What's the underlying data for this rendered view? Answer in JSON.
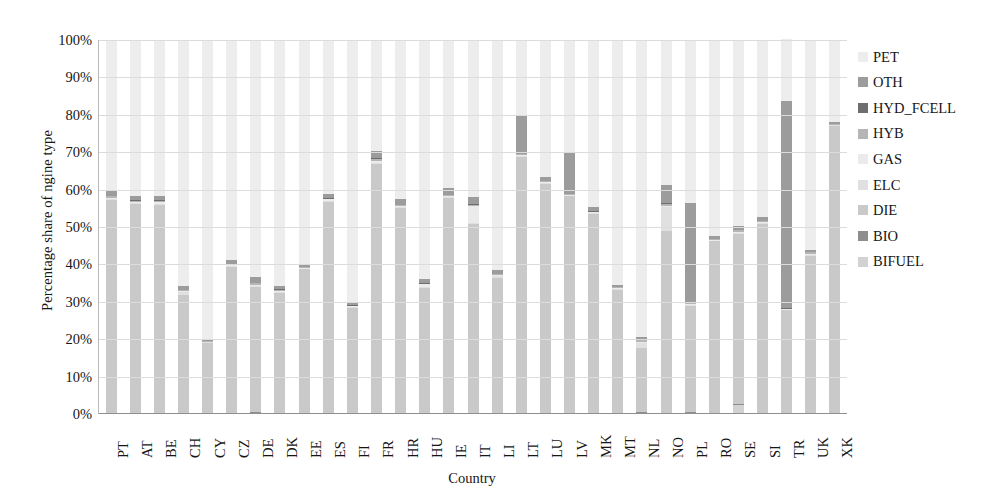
{
  "chart_data": {
    "type": "bar",
    "subtype": "stacked-100-percent",
    "title": "",
    "xlabel": "Country",
    "ylabel": "Percentage share of ngine type",
    "ylim": [
      0,
      100
    ],
    "ytick_labels": [
      "0%",
      "10%",
      "20%",
      "30%",
      "40%",
      "50%",
      "60%",
      "70%",
      "80%",
      "90%",
      "100%"
    ],
    "ytick_values": [
      0,
      10,
      20,
      30,
      40,
      50,
      60,
      70,
      80,
      90,
      100
    ],
    "grid": true,
    "legend_position": "right",
    "categories": [
      "PT",
      "AT",
      "BE",
      "CH",
      "CY",
      "CZ",
      "DE",
      "DK",
      "EE",
      "ES",
      "FI",
      "FR",
      "HR",
      "HU",
      "IE",
      "IT",
      "LI",
      "LT",
      "LU",
      "LV",
      "MK",
      "MT",
      "NL",
      "NO",
      "PL",
      "RO",
      "SE",
      "SI",
      "TR",
      "UK",
      "XK"
    ],
    "series": [
      {
        "name": "BIFUEL",
        "color": "#d2d2d2",
        "values": [
          0.2,
          0.2,
          0.3,
          0.2,
          0.1,
          0.3,
          0.4,
          0.3,
          0.2,
          0.3,
          0.3,
          0.3,
          0.2,
          0.2,
          0.2,
          0.3,
          0.2,
          0.2,
          0.3,
          0.2,
          0.1,
          0.2,
          0.5,
          0.3,
          0.4,
          0.2,
          2.5,
          0.2,
          0.2,
          0.2,
          0.1
        ]
      },
      {
        "name": "BIO",
        "color": "#8e8e8e",
        "values": [
          0.1,
          0.1,
          0.1,
          0.1,
          0.1,
          0.1,
          0.1,
          0.1,
          0.1,
          0.1,
          0.1,
          0.1,
          0.1,
          0.1,
          0.1,
          0.1,
          0.1,
          0.1,
          0.1,
          0.1,
          0.1,
          0.1,
          0.1,
          0.1,
          0.1,
          0.1,
          0.1,
          0.1,
          0.1,
          0.1,
          0.1
        ]
      },
      {
        "name": "DIE",
        "color": "#c9c9c9",
        "values": [
          57.0,
          56.0,
          55.5,
          31.5,
          19.0,
          39.0,
          33.5,
          32.0,
          38.5,
          56.5,
          28.0,
          66.5,
          55.0,
          33.5,
          57.5,
          50.5,
          36.0,
          68.5,
          61.0,
          58.0,
          53.5,
          33.0,
          17.0,
          48.5,
          28.5,
          46.0,
          45.5,
          50.5,
          27.5,
          42.0,
          77.0
        ]
      },
      {
        "name": "ELC",
        "color": "#e0e0e0",
        "values": [
          0.2,
          0.2,
          0.3,
          0.9,
          0.1,
          0.1,
          0.3,
          0.4,
          0.1,
          0.1,
          0.2,
          0.3,
          0.1,
          0.1,
          0.2,
          0.2,
          0.8,
          0.1,
          0.3,
          0.1,
          0.1,
          0.2,
          1.3,
          6.5,
          0.1,
          0.1,
          0.5,
          0.2,
          0.1,
          0.4,
          0.1
        ]
      },
      {
        "name": "GAS",
        "color": "#ebebeb",
        "values": [
          0.3,
          0.2,
          0.4,
          0.2,
          0.1,
          0.4,
          0.3,
          0.2,
          0.2,
          0.4,
          0.2,
          0.5,
          0.3,
          0.8,
          0.2,
          4.5,
          0.1,
          0.3,
          0.3,
          0.2,
          0.2,
          0.2,
          0.3,
          0.3,
          0.4,
          0.2,
          0.2,
          0.3,
          0.2,
          0.2,
          0.1
        ]
      },
      {
        "name": "HYB",
        "color": "#b5b5b5",
        "values": [
          0.5,
          0.4,
          0.5,
          0.3,
          0.2,
          0.3,
          0.5,
          0.4,
          0.2,
          0.3,
          0.3,
          0.6,
          0.3,
          0.3,
          0.4,
          0.5,
          0.3,
          0.4,
          0.4,
          0.3,
          0.2,
          0.3,
          0.9,
          0.6,
          0.3,
          0.2,
          0.4,
          0.3,
          0.2,
          0.5,
          0.2
        ]
      },
      {
        "name": "HYD_FCELL",
        "color": "#6e6e6e",
        "values": [
          0.02,
          0.02,
          0.02,
          0.02,
          0.02,
          0.02,
          0.02,
          0.02,
          0.02,
          0.02,
          0.02,
          0.02,
          0.02,
          0.02,
          0.02,
          0.02,
          0.02,
          0.02,
          0.02,
          0.02,
          0.02,
          0.02,
          0.02,
          0.02,
          0.02,
          0.02,
          0.02,
          0.02,
          0.02,
          0.02,
          0.02
        ]
      },
      {
        "name": "OTH",
        "color": "#9c9c9c",
        "values": [
          1.7,
          1.1,
          1.2,
          1.0,
          0.5,
          1.0,
          1.4,
          0.7,
          0.8,
          1.2,
          0.5,
          2.0,
          1.5,
          1.1,
          1.8,
          2.0,
          1.0,
          10.0,
          1.0,
          11.0,
          1.0,
          0.5,
          0.6,
          5.0,
          26.5,
          0.8,
          1.0,
          1.0,
          55.5,
          0.5,
          0.5
        ]
      },
      {
        "name": "PET",
        "color": "#ededed",
        "values": [
          40.0,
          41.8,
          41.7,
          65.8,
          79.9,
          58.8,
          63.5,
          65.9,
          59.9,
          41.1,
          70.4,
          29.7,
          42.5,
          63.9,
          39.6,
          41.9,
          61.5,
          20.4,
          36.6,
          30.1,
          44.8,
          65.5,
          79.3,
          38.7,
          43.7,
          52.4,
          49.8,
          47.4,
          16.4,
          56.1,
          21.9
        ]
      }
    ],
    "legend_order": [
      "PET",
      "OTH",
      "HYD_FCELL",
      "HYB",
      "GAS",
      "ELC",
      "DIE",
      "BIO",
      "BIFUEL"
    ],
    "stack_order_bottom_to_top": [
      "BIFUEL",
      "BIO",
      "DIE",
      "ELC",
      "GAS",
      "HYB",
      "HYD_FCELL",
      "OTH",
      "PET"
    ]
  },
  "legend": {
    "items": [
      {
        "label": "PET",
        "color": "#ededed"
      },
      {
        "label": "OTH",
        "color": "#9c9c9c"
      },
      {
        "label": "HYD_FCELL",
        "color": "#6e6e6e"
      },
      {
        "label": "HYB",
        "color": "#b5b5b5"
      },
      {
        "label": "GAS",
        "color": "#ebebeb"
      },
      {
        "label": "ELC",
        "color": "#e0e0e0"
      },
      {
        "label": "DIE",
        "color": "#c9c9c9"
      },
      {
        "label": "BIO",
        "color": "#8e8e8e"
      },
      {
        "label": "BIFUEL",
        "color": "#d2d2d2"
      }
    ]
  },
  "axes": {
    "y_title": "Percentage share of ngine type",
    "x_title": "Country"
  }
}
